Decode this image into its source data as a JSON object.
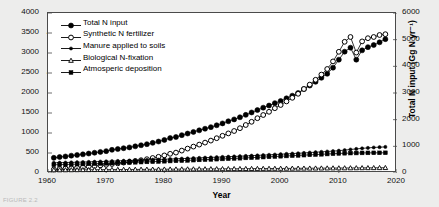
{
  "chart_data": {
    "type": "line",
    "title": "",
    "xlabel": "Year",
    "ylabel": "N Input (Gg N yr⁻¹)",
    "y2label": "Total N input (Gg N yr⁻¹)",
    "xlim": [
      1960,
      2020
    ],
    "ylim": [
      0,
      4000
    ],
    "y2lim": [
      0,
      6000
    ],
    "xticks": [
      1960,
      1970,
      1980,
      1990,
      2000,
      2010,
      2020
    ],
    "yticks": [
      0,
      500,
      1000,
      1500,
      2000,
      2500,
      3000,
      3500,
      4000
    ],
    "y2ticks": [
      0,
      1000,
      2000,
      3000,
      4000,
      5000,
      6000
    ],
    "grid": false,
    "legend_position": "top-left",
    "x": [
      1961,
      1962,
      1963,
      1964,
      1965,
      1966,
      1967,
      1968,
      1969,
      1970,
      1971,
      1972,
      1973,
      1974,
      1975,
      1976,
      1977,
      1978,
      1979,
      1980,
      1981,
      1982,
      1983,
      1984,
      1985,
      1986,
      1987,
      1988,
      1989,
      1990,
      1991,
      1992,
      1993,
      1994,
      1995,
      1996,
      1997,
      1998,
      1999,
      2000,
      2001,
      2002,
      2003,
      2004,
      2005,
      2006,
      2007,
      2008,
      2009,
      2010,
      2011,
      2012,
      2013,
      2014,
      2015,
      2016,
      2017,
      2018
    ],
    "series": [
      {
        "name": "Total N input",
        "marker": "filled-circle",
        "axis": "right",
        "values": [
          570,
          600,
          620,
          650,
          675,
          700,
          730,
          760,
          790,
          820,
          870,
          900,
          930,
          960,
          1000,
          1040,
          1080,
          1130,
          1180,
          1240,
          1310,
          1350,
          1420,
          1480,
          1540,
          1600,
          1660,
          1720,
          1790,
          1860,
          1940,
          2010,
          2090,
          2180,
          2270,
          2360,
          2450,
          2530,
          2620,
          2700,
          2800,
          2900,
          3000,
          3150,
          3280,
          3420,
          3570,
          3720,
          3950,
          4250,
          4550,
          4700,
          4250,
          4600,
          4720,
          4800,
          4900,
          5020
        ]
      },
      {
        "name": "Synthetic N fertilizer",
        "marker": "open-circle",
        "axis": "left",
        "values": [
          90,
          100,
          110,
          120,
          130,
          145,
          160,
          175,
          190,
          205,
          225,
          240,
          260,
          280,
          300,
          320,
          345,
          375,
          405,
          440,
          480,
          510,
          560,
          610,
          660,
          710,
          760,
          810,
          870,
          930,
          990,
          1050,
          1120,
          1200,
          1280,
          1370,
          1450,
          1530,
          1620,
          1700,
          1790,
          1880,
          1980,
          2100,
          2210,
          2330,
          2460,
          2600,
          2790,
          3030,
          3280,
          3400,
          3010,
          3290,
          3370,
          3400,
          3450,
          3470
        ]
      },
      {
        "name": "Manure applied to soils",
        "marker": "small-filled-circle",
        "axis": "left",
        "values": [
          255,
          258,
          262,
          266,
          270,
          274,
          278,
          282,
          287,
          292,
          297,
          302,
          307,
          312,
          318,
          323,
          328,
          333,
          338,
          344,
          350,
          355,
          360,
          366,
          372,
          378,
          384,
          390,
          396,
          402,
          408,
          414,
          420,
          427,
          434,
          441,
          448,
          455,
          462,
          470,
          478,
          486,
          494,
          502,
          511,
          520,
          529,
          538,
          548,
          558,
          572,
          588,
          602,
          616,
          628,
          638,
          646,
          652
        ]
      },
      {
        "name": "Biological N-fixation",
        "marker": "open-triangle",
        "axis": "left",
        "values": [
          75,
          76,
          77,
          78,
          79,
          80,
          81,
          82,
          83,
          84,
          85,
          86,
          87,
          88,
          89,
          90,
          91,
          92,
          93,
          94,
          95,
          96,
          97,
          98,
          99,
          100,
          101,
          102,
          103,
          104,
          105,
          106,
          107,
          108,
          109,
          110,
          111,
          112,
          113,
          114,
          115,
          116,
          117,
          118,
          119,
          120,
          121,
          122,
          123,
          124,
          125,
          126,
          127,
          128,
          129,
          130,
          131,
          132
        ]
      },
      {
        "name": "Atmosperic deposition",
        "marker": "filled-square",
        "axis": "left",
        "values": [
          205,
          209,
          213,
          217,
          221,
          225,
          229,
          233,
          238,
          243,
          248,
          253,
          258,
          263,
          268,
          273,
          278,
          283,
          288,
          294,
          300,
          305,
          310,
          316,
          322,
          328,
          334,
          340,
          346,
          352,
          358,
          364,
          370,
          377,
          384,
          391,
          398,
          405,
          412,
          419,
          426,
          433,
          440,
          447,
          454,
          461,
          468,
          475,
          482,
          489,
          494,
          498,
          500,
          502,
          503,
          504,
          504,
          505
        ]
      }
    ]
  },
  "axes": {
    "x_title": "Year",
    "y_left_title": "N Input (Gg N yr⁻¹)",
    "y_right_title": "Total N input (Gg N yr⁻¹)"
  },
  "legend": {
    "items": [
      {
        "label": "Total N input",
        "marker": "filled-circle"
      },
      {
        "label": "Synthetic N fertilizer",
        "marker": "open-circle"
      },
      {
        "label": "Manure applied to soils",
        "marker": "small-filled-circle"
      },
      {
        "label": "Biological N-fixation",
        "marker": "open-triangle"
      },
      {
        "label": "Atmosperic deposition",
        "marker": "filled-square"
      }
    ]
  },
  "caption": {
    "text": "FIGURE 2.2"
  },
  "colors": {
    "series": "#000000",
    "frame": "#4a4a4a",
    "panel_background": "#ffffff",
    "figure_background": "#ededec"
  }
}
